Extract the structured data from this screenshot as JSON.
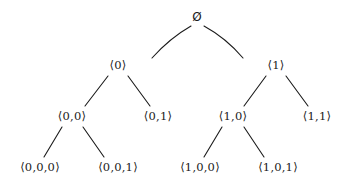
{
  "figure": {
    "name": "binary-sequence-tree",
    "background_color": "#ffffff",
    "ink_color": "#1a1a1a",
    "width": 349,
    "height": 189
  },
  "nodes": [
    {
      "id": "root",
      "label": "Ø",
      "x": 197,
      "y": 17,
      "level": 0
    },
    {
      "id": "n0",
      "label": "⟨0⟩",
      "x": 118,
      "y": 66,
      "level": 1
    },
    {
      "id": "n1",
      "label": "⟨1⟩",
      "x": 276,
      "y": 66,
      "level": 1
    },
    {
      "id": "n00",
      "label": "⟨0,0⟩",
      "x": 72,
      "y": 117,
      "level": 2
    },
    {
      "id": "n01",
      "label": "⟨0,1⟩",
      "x": 158,
      "y": 117,
      "level": 2
    },
    {
      "id": "n10",
      "label": "⟨1,0⟩",
      "x": 233,
      "y": 117,
      "level": 2
    },
    {
      "id": "n11",
      "label": "⟨1,1⟩",
      "x": 317,
      "y": 117,
      "level": 2
    },
    {
      "id": "n000",
      "label": "⟨0,0,0⟩",
      "x": 40,
      "y": 168,
      "level": 3
    },
    {
      "id": "n001",
      "label": "⟨0,0,1⟩",
      "x": 118,
      "y": 168,
      "level": 3
    },
    {
      "id": "n100",
      "label": "⟨1,0,0⟩",
      "x": 200,
      "y": 168,
      "level": 3
    },
    {
      "id": "n101",
      "label": "⟨1,0,1⟩",
      "x": 278,
      "y": 168,
      "level": 3
    }
  ],
  "edges": [
    {
      "from": "root",
      "to": "n0",
      "type": "curve",
      "x1": 191,
      "y1": 26,
      "cx": 170,
      "cy": 38,
      "x2": 152,
      "y2": 58
    },
    {
      "from": "root",
      "to": "n1",
      "type": "curve",
      "x1": 204,
      "y1": 26,
      "cx": 226,
      "cy": 38,
      "x2": 243,
      "y2": 58
    },
    {
      "from": "n0",
      "to": "n00",
      "type": "line",
      "x1": 108,
      "y1": 76,
      "x2": 85,
      "y2": 106
    },
    {
      "from": "n0",
      "to": "n01",
      "type": "line",
      "x1": 128,
      "y1": 76,
      "x2": 150,
      "y2": 106
    },
    {
      "from": "n1",
      "to": "n10",
      "type": "line",
      "x1": 266,
      "y1": 76,
      "x2": 244,
      "y2": 106
    },
    {
      "from": "n1",
      "to": "n11",
      "type": "line",
      "x1": 286,
      "y1": 76,
      "x2": 308,
      "y2": 106
    },
    {
      "from": "n00",
      "to": "n000",
      "type": "line",
      "x1": 62,
      "y1": 127,
      "x2": 44,
      "y2": 157
    },
    {
      "from": "n00",
      "to": "n001",
      "type": "line",
      "x1": 83,
      "y1": 127,
      "x2": 104,
      "y2": 157
    },
    {
      "from": "n10",
      "to": "n100",
      "type": "line",
      "x1": 222,
      "y1": 127,
      "x2": 204,
      "y2": 157
    },
    {
      "from": "n10",
      "to": "n101",
      "type": "line",
      "x1": 244,
      "y1": 127,
      "x2": 264,
      "y2": 157
    }
  ],
  "style": {
    "stroke_width": 1.1
  }
}
